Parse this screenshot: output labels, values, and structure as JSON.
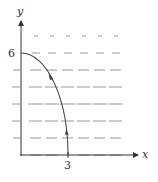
{
  "diagram": {
    "type": "direction-field",
    "axes": {
      "x_label": "x",
      "y_label": "y",
      "x_tick_label": "3",
      "y_tick_label": "6",
      "x_tick_value": 3,
      "y_tick_value": 6
    },
    "curve": {
      "description": "quarter ellipse from (0,6) to (3,0) with direction arrows",
      "start": [
        0,
        6
      ],
      "end": [
        3,
        0
      ]
    },
    "colors": {
      "axis": "#333333",
      "curve": "#444444",
      "dash": "#9a9a9a",
      "text": "#333333"
    }
  }
}
